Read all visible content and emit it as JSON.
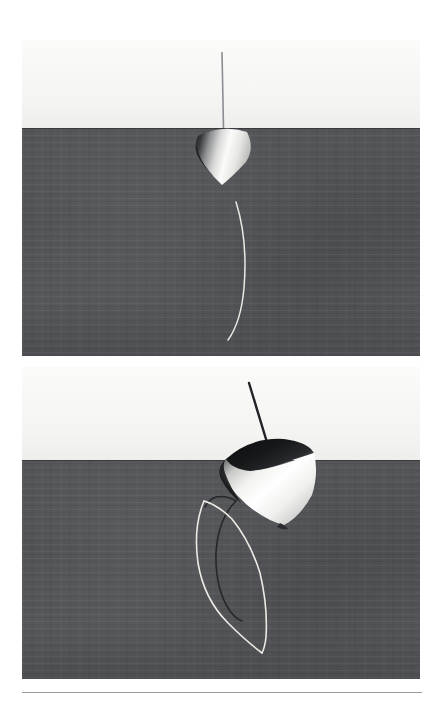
{
  "document": {
    "title": "Spinning top simulation renders",
    "background_color": "#ffffff",
    "panel_count": 2
  },
  "panels": [
    {
      "id": "panel-top",
      "caption": "",
      "scene": "spinning top, upright, narrow precession trace",
      "sky_color": "#f6f6f4",
      "ground_color": "#4f5153",
      "horizon_y_fraction": 0.278,
      "top_body": {
        "label": "top-body",
        "tilt_degrees": 6,
        "highlight_color": "#fdfdfc",
        "shadow_color": "#2b2c2e",
        "size": "small"
      },
      "stem": {
        "label": "top-stem",
        "orientation": "vertical",
        "color": "#8b8d90"
      },
      "trace": {
        "label": "tip-trace",
        "shape": "single shallow arc",
        "color": "#e9e9e4",
        "loops": 1
      }
    },
    {
      "id": "panel-bot",
      "caption": "",
      "scene": "spinning top, strongly tilted, looping precession trace",
      "sky_color": "#f6f6f4",
      "ground_color": "#4f5153",
      "horizon_y_fraction": 0.298,
      "top_body": {
        "label": "top-body",
        "tilt_degrees": 34,
        "highlight_color": "#ffffff",
        "shadow_color": "#17181a",
        "size": "large"
      },
      "stem": {
        "label": "top-stem",
        "orientation": "tilted",
        "color": "#2a2b2d"
      },
      "trace": {
        "label": "tip-trace",
        "shape": "double elongated loop",
        "color": "#e9e9e4",
        "secondary_color": "#26272a",
        "loops": 2
      }
    }
  ],
  "footer": {
    "rule_color": "#9a9a9a",
    "rule_label": "horizontal-rule"
  }
}
